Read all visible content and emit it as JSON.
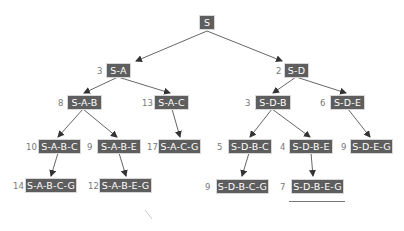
{
  "diagram": {
    "type": "search-tree",
    "colors": {
      "node_fill": "#5e5e5e",
      "node_text": "#ffffff",
      "edge": "#555555",
      "cost_text": "#777777"
    },
    "nodes": [
      {
        "id": "S",
        "label": "S",
        "cost": ""
      },
      {
        "id": "SA",
        "label": "S-A",
        "cost": "3"
      },
      {
        "id": "SD",
        "label": "S-D",
        "cost": "2"
      },
      {
        "id": "SAB",
        "label": "S-A-B",
        "cost": "8"
      },
      {
        "id": "SAC",
        "label": "S-A-C",
        "cost": "13"
      },
      {
        "id": "SDB",
        "label": "S-D-B",
        "cost": "3"
      },
      {
        "id": "SDE",
        "label": "S-D-E",
        "cost": "6"
      },
      {
        "id": "SABC",
        "label": "S-A-B-C",
        "cost": "10"
      },
      {
        "id": "SABE",
        "label": "S-A-B-E",
        "cost": "9"
      },
      {
        "id": "SACG",
        "label": "S-A-C-G",
        "cost": "17"
      },
      {
        "id": "SDBC",
        "label": "S-D-B-C",
        "cost": "5"
      },
      {
        "id": "SDBE",
        "label": "S-D-B-E",
        "cost": "4"
      },
      {
        "id": "SDEG",
        "label": "S-D-E-G",
        "cost": "9"
      },
      {
        "id": "SABCG",
        "label": "S-A-B-C-G",
        "cost": "14"
      },
      {
        "id": "SABEG",
        "label": "S-A-B-E-G",
        "cost": "12"
      },
      {
        "id": "SDBCG",
        "label": "S-D-B-C-G",
        "cost": "9"
      },
      {
        "id": "SDBEG",
        "label": "S-D-B-E-G",
        "cost": "7"
      }
    ],
    "edges": [
      [
        "S",
        "SA"
      ],
      [
        "S",
        "SD"
      ],
      [
        "SA",
        "SAB"
      ],
      [
        "SA",
        "SAC"
      ],
      [
        "SD",
        "SDB"
      ],
      [
        "SD",
        "SDE"
      ],
      [
        "SAB",
        "SABC"
      ],
      [
        "SAB",
        "SABE"
      ],
      [
        "SAC",
        "SACG"
      ],
      [
        "SDB",
        "SDBC"
      ],
      [
        "SDB",
        "SDBE"
      ],
      [
        "SDE",
        "SDEG"
      ],
      [
        "SABC",
        "SABCG"
      ],
      [
        "SABE",
        "SABEG"
      ],
      [
        "SDBC",
        "SDBCG"
      ],
      [
        "SDBE",
        "SDBEG"
      ]
    ],
    "highlighted_solution": "SDBEG"
  }
}
